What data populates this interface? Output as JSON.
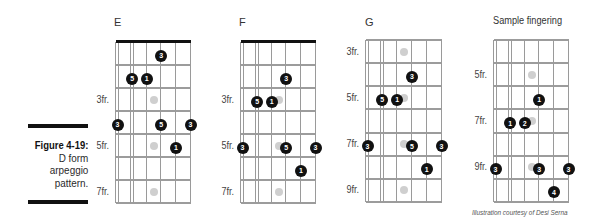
{
  "caption": {
    "figure_label": "Figure 4-19:",
    "lines": [
      "D form",
      "arpeggio",
      "pattern."
    ]
  },
  "diagrams": [
    {
      "title": "E",
      "strings": 6,
      "rows": 7,
      "nut": true,
      "inlay_rows": [
        3,
        5,
        7
      ],
      "fret_labels": [
        {
          "row": 3,
          "text": "3fr."
        },
        {
          "row": 5,
          "text": "5fr."
        },
        {
          "row": 7,
          "text": "7fr."
        }
      ],
      "dots": [
        {
          "string": 4,
          "row": 1,
          "label": "3"
        },
        {
          "string": 2,
          "row": 2,
          "label": "5"
        },
        {
          "string": 3,
          "row": 2,
          "label": "1"
        },
        {
          "string": 1,
          "row": 4,
          "label": "3"
        },
        {
          "string": 4,
          "row": 4,
          "label": "5"
        },
        {
          "string": 6,
          "row": 4,
          "label": "3"
        },
        {
          "string": 5,
          "row": 5,
          "label": "1"
        }
      ]
    },
    {
      "title": "F",
      "strings": 6,
      "rows": 7,
      "nut": true,
      "inlay_rows": [
        3,
        5,
        7
      ],
      "fret_labels": [
        {
          "row": 3,
          "text": "3fr."
        },
        {
          "row": 5,
          "text": "5fr."
        },
        {
          "row": 7,
          "text": "7fr."
        }
      ],
      "dots": [
        {
          "string": 4,
          "row": 2,
          "label": "3"
        },
        {
          "string": 2,
          "row": 3,
          "label": "5"
        },
        {
          "string": 3,
          "row": 3,
          "label": "1"
        },
        {
          "string": 1,
          "row": 5,
          "label": "3"
        },
        {
          "string": 4,
          "row": 5,
          "label": "5"
        },
        {
          "string": 6,
          "row": 5,
          "label": "3"
        },
        {
          "string": 5,
          "row": 6,
          "label": "1"
        }
      ]
    },
    {
      "title": "G",
      "strings": 6,
      "rows": 7,
      "nut": false,
      "inlay_rows": [
        1,
        3,
        5,
        7
      ],
      "fret_labels": [
        {
          "row": 1,
          "text": "3fr."
        },
        {
          "row": 3,
          "text": "5fr."
        },
        {
          "row": 5,
          "text": "7fr."
        },
        {
          "row": 7,
          "text": "9fr."
        }
      ],
      "dots": [
        {
          "string": 4,
          "row": 2,
          "label": "3"
        },
        {
          "string": 2,
          "row": 3,
          "label": "5"
        },
        {
          "string": 3,
          "row": 3,
          "label": "1"
        },
        {
          "string": 1,
          "row": 5,
          "label": "3"
        },
        {
          "string": 4,
          "row": 5,
          "label": "5"
        },
        {
          "string": 6,
          "row": 5,
          "label": "3"
        },
        {
          "string": 5,
          "row": 6,
          "label": "1"
        }
      ]
    },
    {
      "title": "Sample fingering",
      "strings": 6,
      "rows": 7,
      "nut": false,
      "inlay_rows": [
        2,
        4,
        6
      ],
      "fret_labels": [
        {
          "row": 2,
          "text": "5fr."
        },
        {
          "row": 4,
          "text": "7fr."
        },
        {
          "row": 6,
          "text": "9fr."
        }
      ],
      "dots": [
        {
          "string": 4,
          "row": 3,
          "label": "1"
        },
        {
          "string": 2,
          "row": 4,
          "label": "1"
        },
        {
          "string": 3,
          "row": 4,
          "label": "2"
        },
        {
          "string": 1,
          "row": 6,
          "label": "3"
        },
        {
          "string": 4,
          "row": 6,
          "label": "3"
        },
        {
          "string": 6,
          "row": 6,
          "label": "3"
        },
        {
          "string": 5,
          "row": 7,
          "label": "4"
        }
      ]
    }
  ],
  "credit": "Illustration courtesy of Desi Serna",
  "colors": {
    "dot": "#111111",
    "dot_text": "#ffffff",
    "inlay": "#cfcfcf",
    "grid": "#9a9a9a",
    "nut": "#111111"
  }
}
